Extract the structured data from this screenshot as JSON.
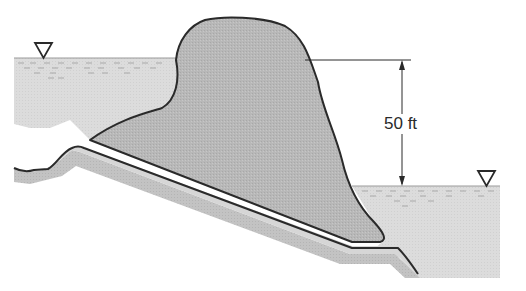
{
  "diagram": {
    "type": "cross-section",
    "labels": {
      "head_difference": "50 ft"
    },
    "symbols": {
      "upstream_water_level": "inverted-triangle",
      "downstream_water_level": "inverted-triangle"
    },
    "colors": {
      "water": "#d9d9d9",
      "slide_mass": "#b5b5b5",
      "bedrock_band": "#c4c4c4",
      "thin_layer": "#d8d8d8",
      "outline": "#2a2a2a",
      "background": "#ffffff"
    }
  }
}
